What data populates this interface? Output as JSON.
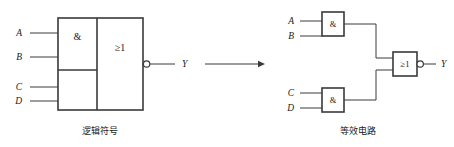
{
  "figure": {
    "title": "",
    "background_color": "#ffffff",
    "line_color": "#3a3a3a",
    "text_color": "#1a1a1a"
  },
  "left_diagram": {
    "caption": "逻辑符号",
    "inputs": [
      {
        "label": "A"
      },
      {
        "label": "B"
      },
      {
        "label": "C"
      },
      {
        "label": "D"
      }
    ],
    "output": {
      "label": "Y",
      "inverted": true
    },
    "blocks": [
      {
        "symbol": "&",
        "name": "and-top"
      },
      {
        "symbol": "",
        "name": "and-bottom"
      },
      {
        "symbol": "≥1",
        "name": "or-merged"
      }
    ]
  },
  "transform_arrow": {
    "direction": "right",
    "label": ""
  },
  "right_diagram": {
    "caption": "等效电路",
    "gates": [
      {
        "symbol": "&",
        "name": "and-gate-ab",
        "inputs": [
          "A",
          "B"
        ]
      },
      {
        "symbol": "&",
        "name": "and-gate-cd",
        "inputs": [
          "C",
          "D"
        ]
      },
      {
        "symbol": "≥1",
        "name": "nor-gate",
        "inverted": true
      }
    ],
    "inputs": [
      {
        "label": "A"
      },
      {
        "label": "B"
      },
      {
        "label": "C"
      },
      {
        "label": "D"
      }
    ],
    "output": {
      "label": "Y",
      "inverted": true
    }
  }
}
